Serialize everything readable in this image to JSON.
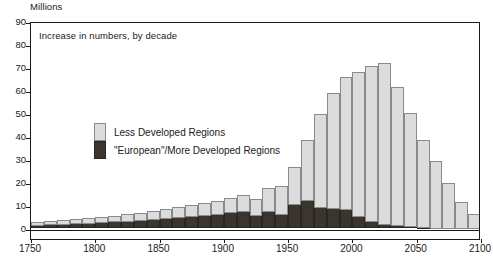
{
  "chart_data": {
    "type": "bar",
    "stacked": true,
    "title": "",
    "annotation": "Increase in numbers, by decade",
    "ylabel": "Millions",
    "xlabel": "",
    "ylim": [
      -5,
      90
    ],
    "yticks": [
      0,
      10,
      20,
      30,
      40,
      50,
      60,
      70,
      80,
      90
    ],
    "xlim": [
      1750,
      2100
    ],
    "xticks": [
      1750,
      1800,
      1850,
      1900,
      1950,
      2000,
      2050,
      2100
    ],
    "xtick_labels": [
      "1750",
      "1800",
      "1850",
      "1900",
      "1950",
      "2000",
      "2050",
      "2100"
    ],
    "grid": false,
    "legend_position": "inside-upper-left",
    "colors": {
      "less_developed": "#dcdcdc",
      "more_developed": "#3b352f",
      "axis": "#1a1a1a",
      "bar_outline": "#8a8a8a",
      "background": "#ffffff"
    },
    "categories": [
      "1750",
      "1760",
      "1770",
      "1780",
      "1790",
      "1800",
      "1810",
      "1820",
      "1830",
      "1840",
      "1850",
      "1860",
      "1870",
      "1880",
      "1890",
      "1900",
      "1910",
      "1920",
      "1930",
      "1940",
      "1950",
      "1960",
      "1970",
      "1980",
      "1990",
      "2000",
      "2010",
      "2020",
      "2030",
      "2040",
      "2050",
      "2060",
      "2070",
      "2080",
      "2090"
    ],
    "series": [
      {
        "name": "\"European\"/More Developed Regions",
        "values": [
          1.3,
          1.5,
          1.7,
          1.9,
          2.1,
          2.4,
          2.7,
          3.0,
          3.4,
          3.8,
          4.2,
          4.6,
          5.0,
          5.6,
          6.1,
          6.6,
          7.0,
          5.5,
          7.3,
          6.0,
          10.2,
          12.0,
          9.0,
          8.3,
          7.9,
          5.2,
          3.0,
          1.5,
          0.9,
          0.5,
          0.2,
          0.0,
          0.0,
          0.0,
          0.0
        ]
      },
      {
        "name": "Less Developed Regions",
        "values": [
          1.3,
          1.4,
          1.5,
          1.7,
          1.9,
          2.1,
          2.4,
          2.7,
          3.1,
          3.5,
          3.9,
          4.2,
          4.7,
          5.1,
          5.6,
          6.3,
          7.3,
          7.0,
          9.9,
          12.0,
          16.3,
          26.0,
          40.4,
          50.5,
          57.5,
          62.4,
          67.6,
          70.2,
          60.3,
          49.4,
          38.0,
          29.0,
          19.4,
          11.2,
          5.8
        ]
      }
    ],
    "totals": [
      2.6,
      2.9,
      3.2,
      3.6,
      4.0,
      4.5,
      5.1,
      5.7,
      6.5,
      7.3,
      8.1,
      8.8,
      9.7,
      10.7,
      11.7,
      12.9,
      14.3,
      12.5,
      17.2,
      18.0,
      26.5,
      38.0,
      49.4,
      58.8,
      65.4,
      67.6,
      70.6,
      71.7,
      61.2,
      49.9,
      38.2,
      29.0,
      19.4,
      11.2,
      5.8
    ],
    "peak": {
      "decade": "2020",
      "value": 71.7
    },
    "final_bar": {
      "decade": "2090",
      "value": -2.0,
      "note": "below zero"
    }
  },
  "legend": {
    "items": [
      {
        "label": "Less Developed Regions",
        "swatch": "light"
      },
      {
        "label": "\"European\"/More Developed Regions",
        "swatch": "dark"
      }
    ]
  }
}
